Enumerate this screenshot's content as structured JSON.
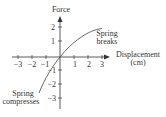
{
  "diagram": {
    "y_axis": {
      "label": "Force",
      "ticks": [
        "2",
        "1",
        "−1",
        "−2",
        "−3"
      ]
    },
    "x_axis": {
      "label_line1": "Displacement",
      "label_line2": "(cm)",
      "ticks": [
        "−3",
        "−2",
        "−1",
        "1",
        "2",
        "3"
      ]
    },
    "annotations": {
      "top_line1": "Spring",
      "top_line2": "breaks",
      "bottom_line1": "Spring",
      "bottom_line2": "compresses"
    },
    "colors": {
      "axis": "#333333",
      "curve": "#555555"
    }
  }
}
